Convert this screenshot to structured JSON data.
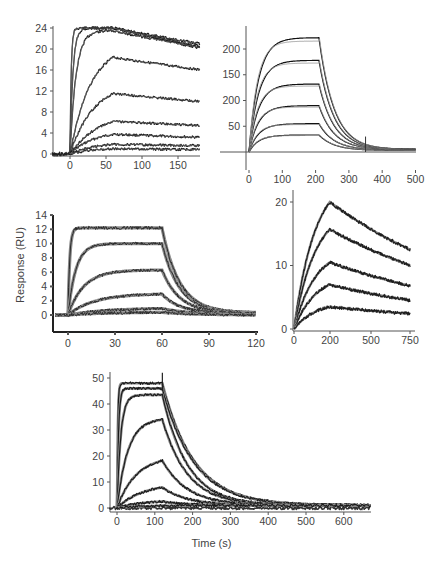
{
  "figure": {
    "shared_xlabel": "Time (s)",
    "shared_ylabel": "Response (RU)"
  },
  "chart_data": [
    {
      "id": "panelA",
      "type": "line",
      "title": "",
      "xlabel": "",
      "ylabel": "",
      "xlim": [
        -25,
        180
      ],
      "ylim": [
        -1,
        25
      ],
      "x_ticks": [
        "0",
        "50",
        "100",
        "150"
      ],
      "y_ticks": [
        "0",
        "4",
        "8",
        "12",
        "16",
        "20",
        "24"
      ],
      "grid": false,
      "injection_end": 60,
      "series": [
        {
          "name": "conc1",
          "plateau": 24,
          "end": 21,
          "ka": 0.6
        },
        {
          "name": "conc2",
          "plateau": 24,
          "end": 20.5,
          "ka": 0.25
        },
        {
          "name": "conc3",
          "plateau": 23.5,
          "end": 20.3,
          "ka": 0.12
        },
        {
          "name": "conc4",
          "plateau": 21,
          "end": 18.3,
          "ka": 0.035
        },
        {
          "name": "conc5",
          "plateau": 13.8,
          "end": 12,
          "ka": 0.03
        },
        {
          "name": "conc6",
          "plateau": 8,
          "end": 7,
          "ka": 0.025
        },
        {
          "name": "conc7",
          "plateau": 4.5,
          "end": 3.8,
          "ka": 0.03
        },
        {
          "name": "conc8",
          "plateau": 2.2,
          "end": 1.9,
          "ka": 0.03
        },
        {
          "name": "conc9",
          "plateau": 1.2,
          "end": 1.0,
          "ka": 0.03
        }
      ]
    },
    {
      "id": "panelB",
      "type": "line",
      "xlim": [
        -10,
        500
      ],
      "ylim": [
        0,
        240
      ],
      "x_ticks": [
        "0",
        "0",
        "100",
        "200",
        "300",
        "400",
        "500"
      ],
      "y_ticks": [
        "50",
        "200",
        "150",
        "200"
      ],
      "grid": false,
      "injection_end": 210,
      "series": [
        {
          "name": "conc1",
          "plateau": 222,
          "end": 5
        },
        {
          "name": "conc2",
          "plateau": 178,
          "end": 5
        },
        {
          "name": "conc3",
          "plateau": 132,
          "end": 5
        },
        {
          "name": "conc4",
          "plateau": 90,
          "end": 5
        },
        {
          "name": "conc5",
          "plateau": 55,
          "end": 4
        },
        {
          "name": "conc6",
          "plateau": 33,
          "end": 3
        }
      ]
    },
    {
      "id": "panelC",
      "type": "line",
      "xlabel": "",
      "ylabel": "Response (RU)",
      "xlim": [
        -10,
        120
      ],
      "ylim": [
        -2,
        14
      ],
      "x_ticks": [
        "0",
        "30",
        "60",
        "90",
        "120"
      ],
      "y_ticks": [
        "0",
        "2",
        "4",
        "6",
        "8",
        "10",
        "12",
        "14"
      ],
      "grid": false,
      "injection_end": 60,
      "series": [
        {
          "name": "conc1",
          "plateau": 12.2
        },
        {
          "name": "conc2",
          "plateau": 10
        },
        {
          "name": "conc3",
          "plateau": 6.3
        },
        {
          "name": "conc4",
          "plateau": 3.0
        },
        {
          "name": "conc5",
          "plateau": 1.0
        },
        {
          "name": "conc6",
          "plateau": 0.4
        }
      ]
    },
    {
      "id": "panelD",
      "type": "line",
      "xlim": [
        0,
        780
      ],
      "ylim": [
        0,
        22
      ],
      "x_ticks": [
        "0",
        "200",
        "500",
        "750"
      ],
      "y_ticks": [
        "0",
        "10",
        "20"
      ],
      "grid": false,
      "injection_end": 240,
      "series": [
        {
          "name": "conc1",
          "peak": 20,
          "end": 12.5
        },
        {
          "name": "conc2",
          "peak": 15.7,
          "end": 10
        },
        {
          "name": "conc3",
          "peak": 10.5,
          "end": 6.8
        },
        {
          "name": "conc4",
          "peak": 7,
          "end": 4.5
        },
        {
          "name": "conc5",
          "peak": 3.5,
          "end": 2.4
        }
      ]
    },
    {
      "id": "panelE",
      "type": "line",
      "xlabel": "Time (s)",
      "ylabel": "",
      "xlim": [
        -20,
        670
      ],
      "ylim": [
        -2,
        52
      ],
      "x_ticks": [
        "0",
        "100",
        "200",
        "300",
        "400",
        "500",
        "600"
      ],
      "y_ticks": [
        "0",
        "10",
        "20",
        "30",
        "40",
        "50"
      ],
      "grid": false,
      "injection_end": 120,
      "series": [
        {
          "name": "conc1",
          "plateau": 48
        },
        {
          "name": "conc2",
          "plateau": 46
        },
        {
          "name": "conc3",
          "plateau": 43.5
        },
        {
          "name": "conc4",
          "plateau": 34.5
        },
        {
          "name": "conc5",
          "plateau": 20
        },
        {
          "name": "conc6",
          "plateau": 9.5
        },
        {
          "name": "conc7",
          "plateau": 3
        },
        {
          "name": "conc8",
          "plateau": 1
        }
      ]
    }
  ]
}
